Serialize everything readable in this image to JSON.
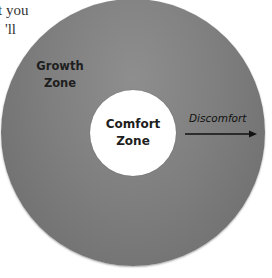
{
  "fragment_text": {
    "line1": "t  you",
    "line2": "'ll"
  },
  "diagram": {
    "outer_zone": {
      "label_line1": "Growth",
      "label_line2": "Zone",
      "color": "#7f7f7f"
    },
    "inner_zone": {
      "label_line1": "Comfort",
      "label_line2": "Zone",
      "color": "#ffffff"
    },
    "arrow": {
      "label": "Discomfort",
      "direction": "right",
      "color": "#111111"
    }
  }
}
